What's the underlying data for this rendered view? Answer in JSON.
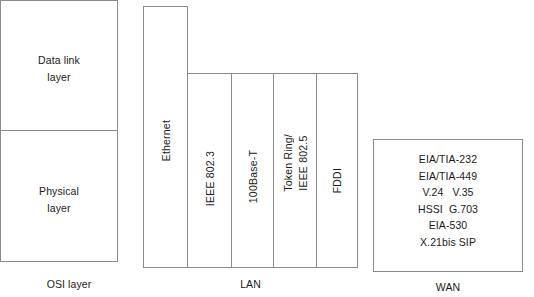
{
  "diagram": {
    "line_color": "#8a8a8a",
    "text_color": "#1a1a1a",
    "background": "#ffffff"
  },
  "osi": {
    "caption": "OSI layer",
    "cells": [
      {
        "id": "data-link",
        "line1": "Data link",
        "line2": "layer"
      },
      {
        "id": "physical",
        "line1": "Physical",
        "line2": "layer"
      }
    ]
  },
  "lan": {
    "caption": "LAN",
    "columns": [
      {
        "id": "ethernet",
        "label": "Ethernet",
        "label2": "",
        "spans_both_layers": true
      },
      {
        "id": "ieee-802-3",
        "label": "IEEE 802.3",
        "label2": "",
        "spans_both_layers": false
      },
      {
        "id": "100base-t",
        "label": "100Base-T",
        "label2": "",
        "spans_both_layers": false
      },
      {
        "id": "token-ring",
        "label": "Token Ring/",
        "label2": "IEEE 802.5",
        "spans_both_layers": false
      },
      {
        "id": "fddi",
        "label": "FDDI",
        "label2": "",
        "spans_both_layers": false
      }
    ]
  },
  "wan": {
    "caption": "WAN",
    "entries": [
      "EIA/TIA-232",
      "EIA/TIA-449",
      "V.24   V.35",
      "HSSI  G.703",
      "EIA-530",
      "X.21bis SIP"
    ]
  }
}
